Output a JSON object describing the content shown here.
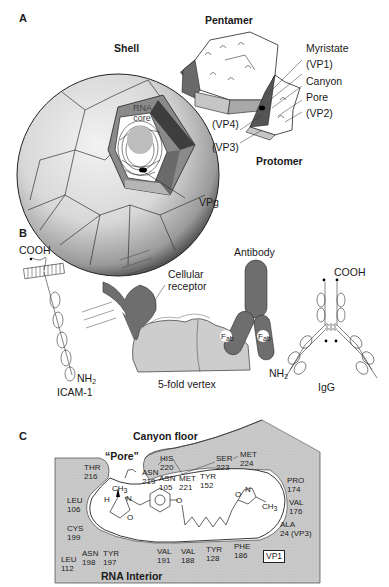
{
  "panels": {
    "a": {
      "letter": "A",
      "titles": {
        "shell": "Shell",
        "pentamer": "Pentamer",
        "protomer": "Protomer"
      },
      "core_label_line1": "RNA",
      "core_label_line2": "core",
      "callouts": {
        "myristate": "Myristate",
        "vp1": "(VP1)",
        "canyon": "Canyon",
        "pore": "Pore",
        "vp2": "(VP2)",
        "vp4": "(VP4)",
        "vp3": "(VP3)",
        "vpg": "VPg"
      }
    },
    "b": {
      "letter": "B",
      "icam": {
        "cooh": "COOH",
        "nh2_base": "NH",
        "nh2_sub": "2",
        "name": "ICAM-1"
      },
      "receptor_line1": "Cellular",
      "receptor_line2": "receptor",
      "antibody": "Antibody",
      "fab_base": "F",
      "fab_sub": "ab",
      "vertex": "5-fold vertex",
      "igg": {
        "cooh": "COOH",
        "nh2_base": "NH",
        "nh2_sub": "2",
        "name": "IgG"
      }
    },
    "c": {
      "letter": "C",
      "canyon_floor": "Canyon floor",
      "pore": "“Pore”",
      "rna_interior": "RNA Interior",
      "vp_box": "VP1",
      "residues": [
        {
          "name": "THR",
          "num": "216"
        },
        {
          "name": "HIS",
          "num": "220"
        },
        {
          "name": "ASN",
          "num": "219"
        },
        {
          "name": "ASN",
          "num": "105"
        },
        {
          "name": "MET",
          "num": "221"
        },
        {
          "name": "TYR",
          "num": "152"
        },
        {
          "name": "SER",
          "num": "223"
        },
        {
          "name": "MET",
          "num": "224"
        },
        {
          "name": "PRO",
          "num": "174"
        },
        {
          "name": "VAL",
          "num": "176"
        },
        {
          "name": "ALA",
          "num": "24  (VP3)"
        },
        {
          "name": "LEU",
          "num": "106"
        },
        {
          "name": "CYS",
          "num": "199"
        },
        {
          "name": "LEU",
          "num": "112"
        },
        {
          "name": "ASN",
          "num": "198"
        },
        {
          "name": "TYR",
          "num": "197"
        },
        {
          "name": "VAL",
          "num": "191"
        },
        {
          "name": "VAL",
          "num": "188"
        },
        {
          "name": "TYR",
          "num": "128"
        },
        {
          "name": "PHE",
          "num": "186"
        }
      ],
      "molecule": {
        "ch3_top": "CH",
        "ch3_sub": "3",
        "h": "H",
        "n": "N",
        "o_ring": "O",
        "o_link": "O",
        "isox_o": "O",
        "isox_n": "N",
        "ch3_right": "CH",
        "ch3_right_sub": "3"
      }
    }
  },
  "colors": {
    "dark_gray": "#5a5a5a",
    "mid_gray": "#8c8c8c",
    "light_gray": "#cfcfcf",
    "pale_gray": "#e4e4e4",
    "line": "#222222"
  }
}
